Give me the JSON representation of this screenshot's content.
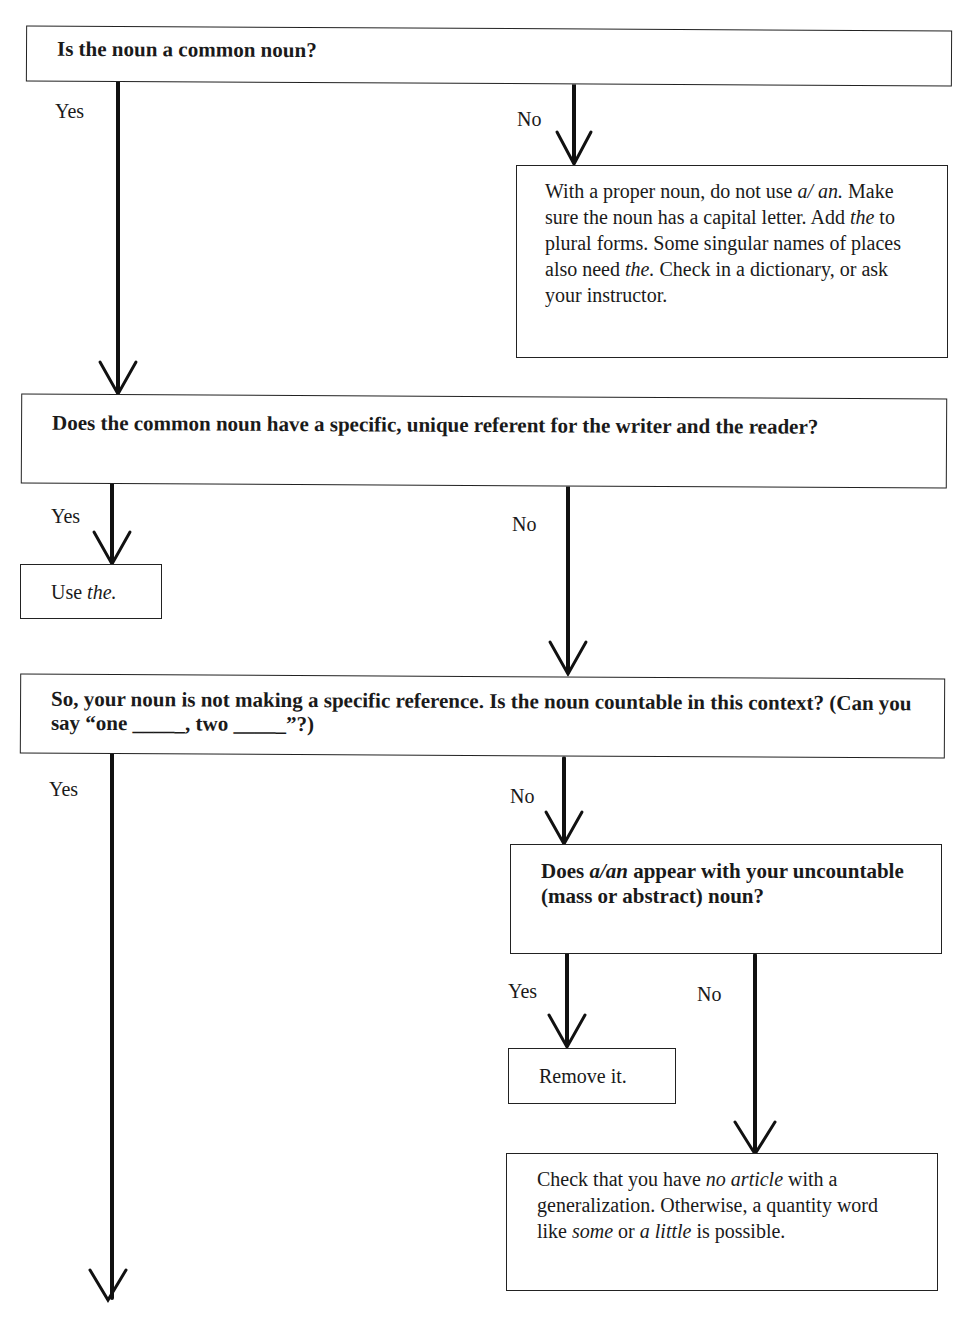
{
  "diagram": {
    "type": "flowchart",
    "nodes": {
      "q1": {
        "text": "Is the noun a common noun?"
      },
      "proper": {
        "parts": [
          "With a proper noun, do not use ",
          "a/",
          " ",
          "an.",
          " Make sure the noun has a capital letter. Add ",
          "the",
          " to plural forms. Some singular names of places also need ",
          "the.",
          " Check in a dictionary, or ask your instructor."
        ]
      },
      "q2": {
        "text": "Does the common noun have a specific, unique referent for the writer and the reader?"
      },
      "use_the": {
        "prefix": "Use ",
        "italic": "the."
      },
      "q3": {
        "text": "So, your noun is not making a specific reference. Is the noun countable in this context? (Can you say “one _____, two _____”?)"
      },
      "q4": {
        "pre": "Does ",
        "italic": "a/an",
        "post": " appear with your uncountable (mass or abstract) noun?"
      },
      "remove": {
        "text": "Remove it."
      },
      "check": {
        "p1": "Check that you have ",
        "i1": "no article",
        "p2": " with a generalization. Otherwise, a quantity word like ",
        "i2": "some",
        "p3": " or ",
        "i3": "a little",
        "p4": " is possible."
      }
    },
    "edges": {
      "q1_yes": "Yes",
      "q1_no": "No",
      "q2_yes": "Yes",
      "q2_no": "No",
      "q3_yes": "Yes",
      "q3_no": "No",
      "q4_yes": "Yes",
      "q4_no": "No"
    }
  }
}
